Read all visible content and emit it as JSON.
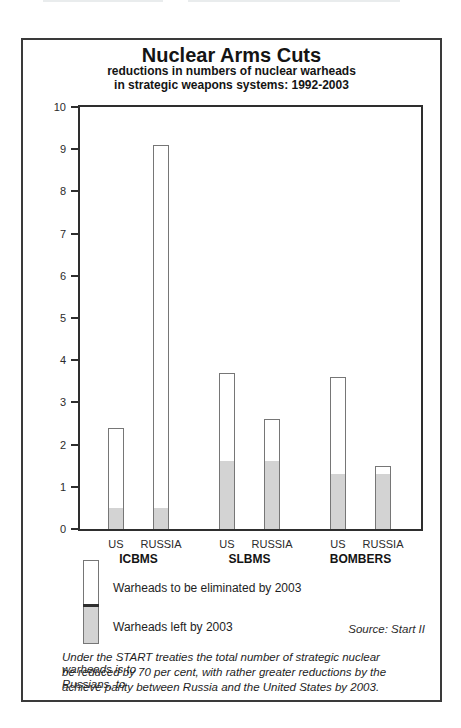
{
  "title": "Nuclear Arms Cuts",
  "subtitle_lines": [
    "reductions in numbers of nuclear warheads",
    "in strategic weapons systems: 1992-2003"
  ],
  "chart_data": {
    "type": "bar",
    "stacked": true,
    "title": "Nuclear Arms Cuts",
    "subtitle": "reductions in numbers of nuclear warheads in strategic weapons systems: 1992-2003",
    "xlabel": "",
    "ylabel": "",
    "ylim": [
      0,
      10
    ],
    "yticks": [
      0,
      1,
      2,
      3,
      4,
      5,
      6,
      7,
      8,
      9,
      10
    ],
    "grid": false,
    "legend_position": "bottom-left",
    "categories": [
      "US ICBMS",
      "RUSSIA ICBMS",
      "US SLBMS",
      "RUSSIA SLBMS",
      "US BOMBERS",
      "RUSSIA BOMBERS"
    ],
    "series": [
      {
        "name": "Warheads left by 2003",
        "color": "#d3d3d3",
        "values": [
          0.5,
          0.5,
          1.6,
          1.6,
          1.3,
          1.3
        ]
      },
      {
        "name": "Warheads to be eliminated by 2003",
        "color": "#ffffff",
        "values": [
          1.9,
          8.6,
          2.1,
          1.0,
          2.3,
          0.2
        ]
      }
    ],
    "groups": [
      {
        "label": "ICBMS",
        "bars": [
          {
            "country": "US",
            "total": 2.4,
            "left_by_2003": 0.5
          },
          {
            "country": "RUSSIA",
            "total": 9.1,
            "left_by_2003": 0.5
          }
        ]
      },
      {
        "label": "SLBMS",
        "bars": [
          {
            "country": "US",
            "total": 3.7,
            "left_by_2003": 1.6
          },
          {
            "country": "RUSSIA",
            "total": 2.6,
            "left_by_2003": 1.6
          }
        ]
      },
      {
        "label": "BOMBERS",
        "bars": [
          {
            "country": "US",
            "total": 3.6,
            "left_by_2003": 1.3
          },
          {
            "country": "RUSSIA",
            "total": 1.5,
            "left_by_2003": 1.3
          }
        ]
      }
    ]
  },
  "legend": {
    "eliminated_label": "Warheads to be eliminated by 2003",
    "left_label": "Warheads left by 2003"
  },
  "source": "Source: Start II",
  "footnote_lines": [
    "Under the START treaties the total number of strategic nuclear warheads is to",
    "be reduced by 70 per cent, with rather greater reductions by the Russians, to",
    "achieve parity between Russia and the United States by 2003."
  ],
  "colors": {
    "left_fill": "#d3d3d3",
    "eliminated_fill": "#ffffff",
    "bar_border": "#767676",
    "axis": "#2e2e2e",
    "text": "#1e1e1e"
  }
}
